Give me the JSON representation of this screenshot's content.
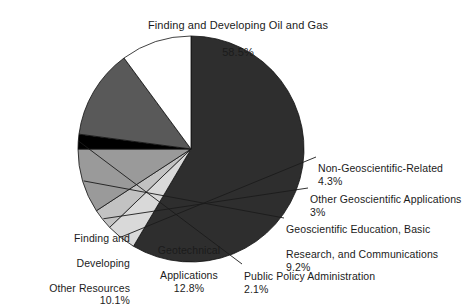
{
  "chart_data": {
    "type": "pie",
    "title": "",
    "xlabel": "",
    "ylabel": "",
    "legend_position": "callout-labels",
    "grid": false,
    "units": "percent",
    "total": 100,
    "start_angle_deg": 0,
    "direction": "clockwise",
    "categories": [
      "Finding and Developing Oil and Gas",
      "Non-Geoscientific-Related",
      "Other Geoscientific Applications",
      "Geoscientific Education, Basic Research, and Communications",
      "Public Policy Administration",
      "Geotechnical Applications",
      "Finding and Developing Other Resources"
    ],
    "values": [
      58.5,
      4.3,
      3,
      9.2,
      2.1,
      12.8,
      10.1
    ],
    "value_labels": [
      "58.5%",
      "4.3%",
      "3%",
      "9.2%",
      "2.1%",
      "12.8%",
      "10.1%"
    ],
    "colors": [
      "#2e2e2e",
      "#d9d9d9",
      "#c2c2c2",
      "#9a9a9a",
      "#000000",
      "#595959",
      "#ffffff"
    ],
    "slices": [
      {
        "id": "oil-and-gas",
        "name": "Finding and Developing Oil and Gas",
        "label_line1": "Finding and Developing Oil and Gas",
        "pct": "58.5%",
        "value": 58.5,
        "color": "#2e2e2e",
        "leader": false
      },
      {
        "id": "non-geoscientific-related",
        "name": "Non-Geoscientific-Related",
        "label_line1": "Non-Geoscientific-Related",
        "pct": "4.3%",
        "value": 4.3,
        "color": "#d9d9d9",
        "leader": true
      },
      {
        "id": "other-geoscientific-applications",
        "name": "Other Geoscientific Applications",
        "label_line1": "Other Geoscientific Applications",
        "pct": "3%",
        "value": 3,
        "color": "#c2c2c2",
        "leader": true
      },
      {
        "id": "geoscientific-education",
        "name": "Geoscientific Education, Basic Research, and Communications",
        "label_line1": "Geoscientific Education, Basic",
        "label_line2": "Research, and Communications",
        "pct": "9.2%",
        "value": 9.2,
        "color": "#9a9a9a",
        "leader": true
      },
      {
        "id": "public-policy-administration",
        "name": "Public Policy Administration",
        "label_line1": "Public Policy Administration",
        "pct": "2.1%",
        "value": 2.1,
        "color": "#000000",
        "leader": true
      },
      {
        "id": "geotechnical-applications",
        "name": "Geotechnical Applications",
        "label_line1": "Geotechnical",
        "label_line2": "Applications",
        "pct": "12.8%",
        "value": 12.8,
        "color": "#595959",
        "leader": false
      },
      {
        "id": "finding-developing-other-resources",
        "name": "Finding and Developing Other Resources",
        "label_line1": "Finding and",
        "label_line2": "Developing",
        "label_line3": "Other Resources",
        "pct": "10.1%",
        "value": 10.1,
        "color": "#ffffff",
        "leader": false
      }
    ]
  },
  "labels": {
    "oilgas": {
      "line1": "Finding and Developing Oil and Gas",
      "pct": "58.5%"
    },
    "nongeo": {
      "line1": "Non-Geoscientific-Related",
      "pct": "4.3%"
    },
    "othergeo": {
      "line1": "Other Geoscientific Applications",
      "pct": "3%"
    },
    "geoedu": {
      "line1": "Geoscientific Education, Basic",
      "line2": "Research, and Communications",
      "pct": "9.2%"
    },
    "pubpol": {
      "line1": "Public Policy Administration",
      "pct": "2.1%"
    },
    "geotech": {
      "line1": "Geotechnical",
      "line2": "Applications",
      "pct": "12.8%"
    },
    "otherres": {
      "line1": "Finding and",
      "line2": "Developing",
      "line3": "Other Resources",
      "pct": "10.1%"
    }
  }
}
